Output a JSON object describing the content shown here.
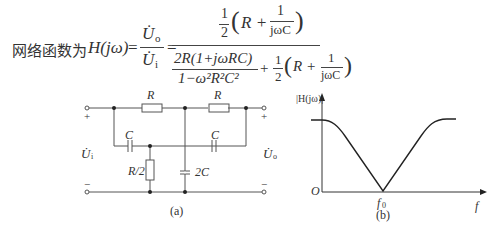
{
  "formula": {
    "prefix": "网络函数为",
    "lhs": "H(jω)",
    "eq1": "=",
    "ratio_num": "U̇",
    "ratio_num_sub": "o",
    "ratio_den": "U̇",
    "ratio_den_sub": "i",
    "eq2": "=",
    "numerator": "½(R + 1/(jωC))",
    "numerator_half": "1",
    "numerator_half_den": "2",
    "numerator_expr": "R +",
    "numerator_frac_num": "1",
    "numerator_frac_den": "jωC",
    "denominator_term1_num": "2R(1+jωRC)",
    "denominator_term1_den": "1−ω²R²C²",
    "denominator_plus": "+",
    "denominator_half": "1",
    "denominator_half_den": "2",
    "denominator_expr": "R +",
    "denominator_frac_num": "1",
    "denominator_frac_den": "jωC"
  },
  "circuit": {
    "caption": "(a)",
    "input_label": "U̇",
    "input_sub": "i",
    "output_label": "U̇",
    "output_sub": "o",
    "plus": "+",
    "minus": "−",
    "components": {
      "r_top_left": "R",
      "r_top_right": "R",
      "c_left": "C",
      "c_right": "C",
      "r_shunt": "R/2",
      "c_shunt": "2C"
    }
  },
  "response_plot": {
    "caption": "(b)",
    "ylabel": "|H(jω)|",
    "xlabel": "f",
    "origin": "O",
    "f0_label": "f",
    "f0_sub": "0"
  }
}
